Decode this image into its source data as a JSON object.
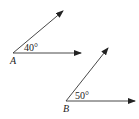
{
  "angles": [
    {
      "vertex_label": "A",
      "angle_label": "40°",
      "vertex": [
        13,
        53
      ],
      "ray1_tip": [
        81,
        53
      ],
      "ray2_tip": [
        63,
        11
      ]
    },
    {
      "vertex_label": "B",
      "angle_label": "50°",
      "vertex": [
        66,
        101
      ],
      "ray1_tip": [
        135,
        101
      ],
      "ray2_tip": [
        108,
        48
      ]
    }
  ],
  "colors": {
    "line": "#333333"
  }
}
